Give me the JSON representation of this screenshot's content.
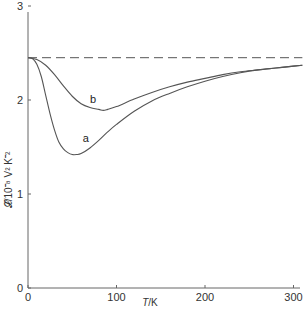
{
  "chart_data": {
    "type": "line",
    "title": "",
    "xlabel": "T/K",
    "ylabel": "𝓛/10⁻⁸ V² K⁻²",
    "xlim": [
      0,
      310
    ],
    "ylim": [
      0,
      3
    ],
    "x_ticks": [
      0,
      100,
      200,
      300
    ],
    "y_ticks": [
      0,
      1,
      2,
      3
    ],
    "grid": false,
    "legend": "none (curves labelled inline)",
    "series": [
      {
        "name": "a",
        "style": "solid",
        "x": [
          0,
          5,
          10,
          15,
          20,
          25,
          30,
          35,
          40,
          45,
          50,
          55,
          60,
          70,
          80,
          90,
          100,
          120,
          140,
          160,
          180,
          200,
          220,
          240,
          260,
          280,
          300,
          310
        ],
        "values": [
          2.45,
          2.44,
          2.38,
          2.25,
          2.05,
          1.85,
          1.68,
          1.55,
          1.48,
          1.44,
          1.42,
          1.42,
          1.43,
          1.49,
          1.57,
          1.66,
          1.74,
          1.88,
          1.99,
          2.07,
          2.14,
          2.2,
          2.25,
          2.29,
          2.32,
          2.34,
          2.36,
          2.37
        ]
      },
      {
        "name": "b",
        "style": "solid",
        "x": [
          0,
          10,
          20,
          30,
          40,
          50,
          60,
          70,
          80,
          85,
          90,
          100,
          120,
          140,
          160,
          180,
          200,
          220,
          240,
          260,
          280,
          300,
          310
        ],
        "values": [
          2.45,
          2.43,
          2.37,
          2.27,
          2.15,
          2.04,
          1.96,
          1.92,
          1.9,
          1.89,
          1.9,
          1.93,
          2.01,
          2.08,
          2.14,
          2.19,
          2.23,
          2.27,
          2.3,
          2.32,
          2.34,
          2.36,
          2.37
        ]
      },
      {
        "name": "Sommerfeld value",
        "style": "dashed",
        "x": [
          0,
          310
        ],
        "values": [
          2.45,
          2.45
        ]
      }
    ],
    "annotations": [
      {
        "text": "a",
        "x": 62,
        "y": 1.55
      },
      {
        "text": "b",
        "x": 70,
        "y": 1.97
      }
    ]
  },
  "axes": {
    "x_tick_labels": [
      "0",
      "100",
      "200",
      "300"
    ],
    "y_tick_labels": [
      "0",
      "1",
      "2",
      "3"
    ],
    "x_title_italic": "T",
    "x_title_rest": "/K",
    "y_title": "𝓛/10⁻⁸ V² K⁻²"
  },
  "labels": {
    "curve_a": "a",
    "curve_b": "b"
  },
  "colors": {
    "line": "#555555",
    "axis": "#666666",
    "text": "#333333"
  }
}
